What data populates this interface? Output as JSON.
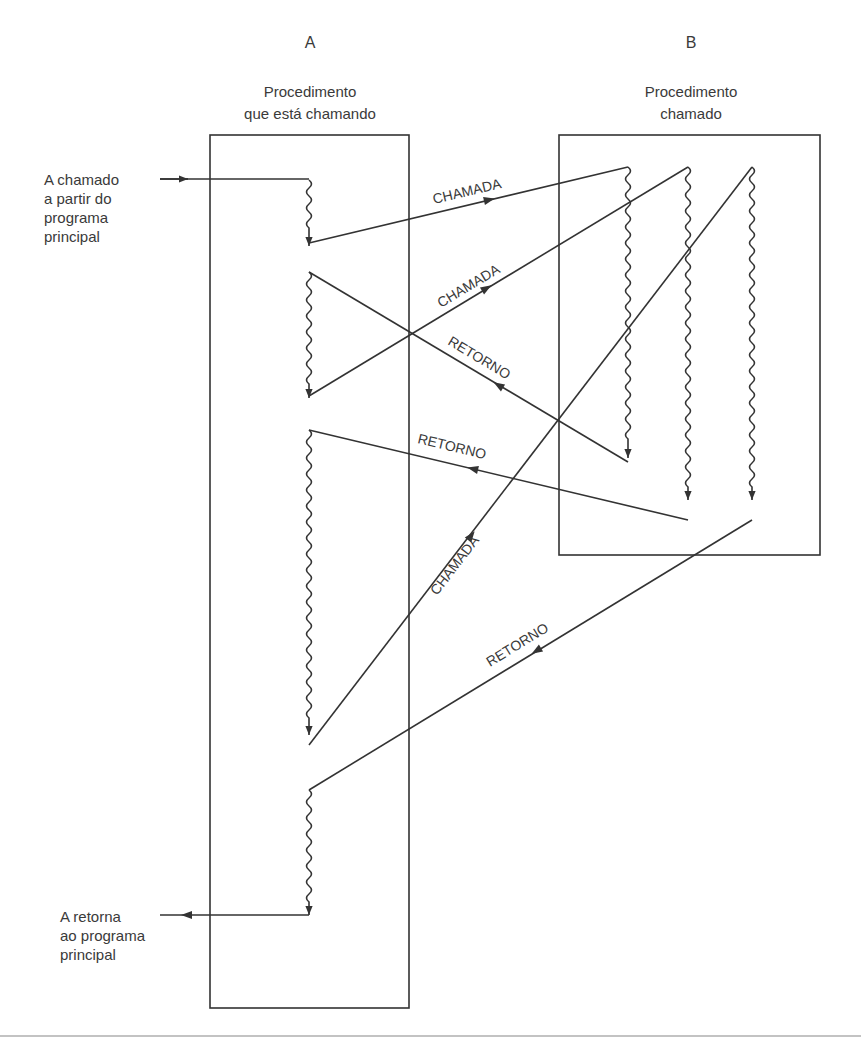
{
  "procedure_a": {
    "letter": "A",
    "title_line1": "Procedimento",
    "title_line2": "que está chamando"
  },
  "procedure_b": {
    "letter": "B",
    "title_line1": "Procedimento",
    "title_line2": "chamado"
  },
  "entry_note": {
    "line1": "A chamado",
    "line2": "a partir do",
    "line3": "programa",
    "line4": "principal"
  },
  "exit_note": {
    "line1": "A retorna",
    "line2": "ao programa",
    "line3": "principal"
  },
  "arrows": [
    {
      "label": "CHAMADA",
      "direction": "A→B"
    },
    {
      "label": "CHAMADA",
      "direction": "A→B"
    },
    {
      "label": "RETORNO",
      "direction": "B→A"
    },
    {
      "label": "RETORNO",
      "direction": "B→A"
    },
    {
      "label": "CHAMADA",
      "direction": "A→B"
    },
    {
      "label": "RETORNO",
      "direction": "B→A"
    }
  ],
  "colors": {
    "stroke": "#333333",
    "text": "#3a3a3a",
    "background": "#ffffff"
  }
}
